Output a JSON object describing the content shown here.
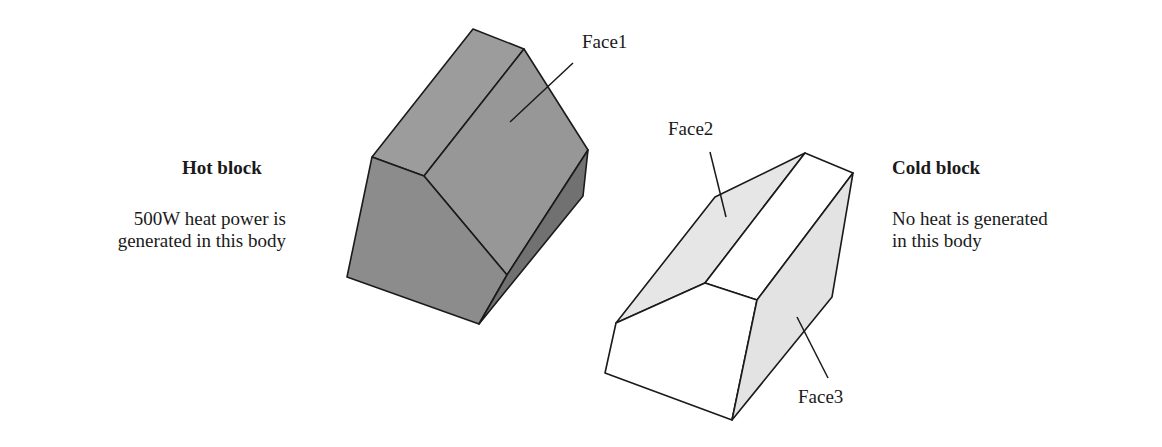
{
  "hot_block": {
    "title": "Hot block",
    "desc_line1": "500W heat power is",
    "desc_line2": "generated in this body",
    "color_top": "#9a9a9a",
    "color_front": "#8a8a8a",
    "color_side": "#6e6e6e"
  },
  "cold_block": {
    "title": "Cold block",
    "desc_line1": "No heat is generated",
    "desc_line2": "in this body",
    "color_face": "#e6e6e6",
    "color_white": "#ffffff"
  },
  "labels": {
    "face1": "Face1",
    "face2": "Face2",
    "face3": "Face3"
  }
}
